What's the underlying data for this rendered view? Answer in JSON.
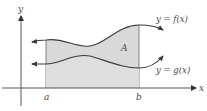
{
  "diagram": {
    "axes": {
      "x_label": "x",
      "y_label": "y"
    },
    "bounds": {
      "a_label": "a",
      "b_label": "b"
    },
    "region": {
      "label": "A",
      "fill_color": "#d9d9d9"
    },
    "curves": [
      {
        "name": "f",
        "label_lhs": "y = ",
        "label_fn": "f(x)",
        "role": "upper"
      },
      {
        "name": "g",
        "label_lhs": "y = ",
        "label_fn": "g(x)",
        "role": "lower"
      }
    ],
    "colors": {
      "axis": "#555555",
      "curve": "#3a3a3a",
      "boundary": "#777777",
      "text": "#4a4a4a"
    }
  }
}
